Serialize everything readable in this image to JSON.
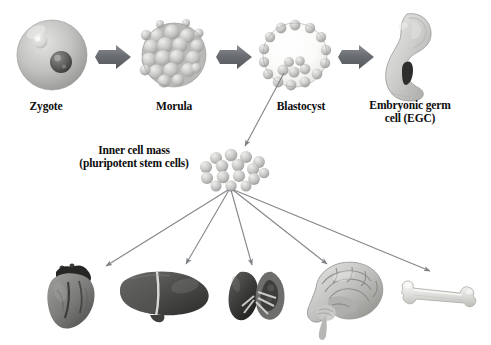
{
  "diagram": {
    "title_visible": false,
    "background": "#ffffff",
    "ink": "#0d0d0d",
    "arrow_gray": "#6f7276",
    "thin_arrow_gray": "#8a8d91"
  },
  "stages": [
    {
      "id": "zygote",
      "label": "Zygote",
      "icon": "zygote-cell",
      "label_x": 46,
      "label_y": 104,
      "cx": 52,
      "cy": 55,
      "r": 36
    },
    {
      "id": "morula",
      "label": "Morula",
      "icon": "morula-cell-ball",
      "label_x": 174,
      "label_y": 104,
      "cx": 174,
      "cy": 55,
      "r": 32
    },
    {
      "id": "blastocyst",
      "label": "Blastocyst",
      "icon": "blastocyst-hollow-sphere",
      "label_x": 303,
      "label_y": 104,
      "cx": 295,
      "cy": 55,
      "r": 32
    },
    {
      "id": "egc",
      "label": "Embryonic germ\ncell (EGC)",
      "label_line1": "Embryonic germ",
      "label_line2": "cell (EGC)",
      "icon": "embryo-figure",
      "label_x": 398,
      "label_y": 104,
      "cx": 412,
      "cy": 55
    }
  ],
  "stage_arrows": [
    {
      "from": "zygote",
      "to": "morula",
      "x1": 90,
      "x2": 138,
      "y": 57
    },
    {
      "from": "morula",
      "to": "blastocyst",
      "x1": 211,
      "x2": 259,
      "y": 57
    },
    {
      "from": "blastocyst",
      "to": "egc",
      "x1": 333,
      "x2": 381,
      "y": 57
    }
  ],
  "inner_cell_mass": {
    "label_line1": "Inner cell mass",
    "label_line2": "(pluripotent stem cells)",
    "label_x": 70,
    "label_y": 148,
    "cluster_cx": 232,
    "cluster_cy": 165,
    "cell_count": 16,
    "pointer_from": {
      "x": 283,
      "y": 72
    },
    "pointer_to": {
      "x": 243,
      "y": 146
    }
  },
  "derivatives": [
    {
      "id": "heart",
      "label": "heart",
      "icon": "heart-organ",
      "cx": 70,
      "cy": 295,
      "arrow_to": {
        "x": 105,
        "y": 267
      }
    },
    {
      "id": "liver",
      "label": "liver",
      "icon": "liver-organ",
      "cx": 162,
      "cy": 295,
      "arrow_to": {
        "x": 185,
        "y": 265
      }
    },
    {
      "id": "kidney",
      "label": "kidney",
      "icon": "kidney-organ-pair",
      "cx": 255,
      "cy": 296,
      "arrow_to": {
        "x": 252,
        "y": 266
      }
    },
    {
      "id": "brain",
      "label": "brain",
      "icon": "brain-organ",
      "cx": 345,
      "cy": 296,
      "arrow_to": {
        "x": 328,
        "y": 265
      }
    },
    {
      "id": "bone",
      "label": "bone",
      "icon": "bone-long",
      "cx": 432,
      "cy": 297,
      "arrow_to": {
        "x": 432,
        "y": 272
      }
    }
  ],
  "differentiation_origin": {
    "x": 228,
    "y": 188
  }
}
